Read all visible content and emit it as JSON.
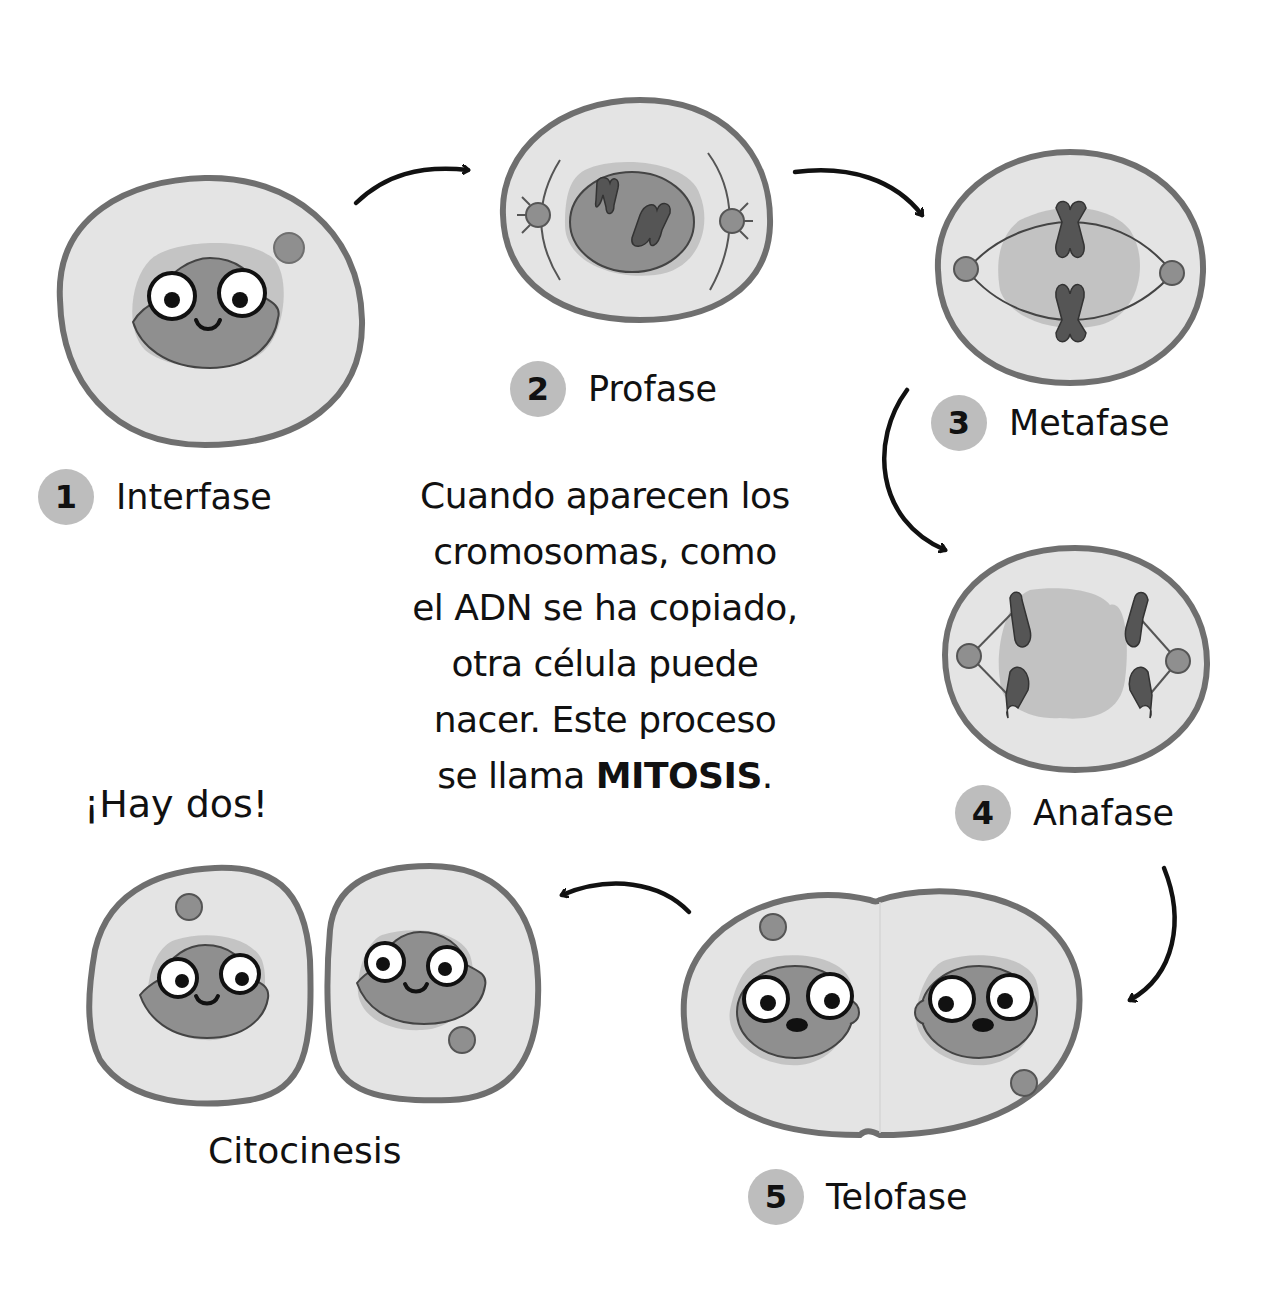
{
  "diagram": {
    "topic": "Mitosis cell cycle",
    "phases": [
      {
        "number": "1",
        "name": "Interfase"
      },
      {
        "number": "2",
        "name": "Profase"
      },
      {
        "number": "3",
        "name": "Metafase"
      },
      {
        "number": "4",
        "name": "Anafase"
      },
      {
        "number": "5",
        "name": "Telofase"
      },
      {
        "number": "",
        "name": "Citocinesis"
      }
    ],
    "narration": {
      "lines": [
        "Cuando aparecen los",
        "cromosomas, como",
        "el ADN se ha copiado,",
        "otra célula puede",
        "nacer. Este proceso"
      ],
      "last_line_prefix": "se llama ",
      "emphasis": "MITOSIS",
      "last_line_suffix": "."
    },
    "exclamation": "¡Hay dos!",
    "colors": {
      "background": "#ffffff",
      "cytoplasm": "#e4e4e4",
      "membrane": "#6f6f6f",
      "nucleus": "#8f8f8f",
      "nucleus_halo": "#bcbcbc",
      "chromosome": "#555555",
      "badge": "#bdbdbd",
      "text": "#111111"
    }
  }
}
